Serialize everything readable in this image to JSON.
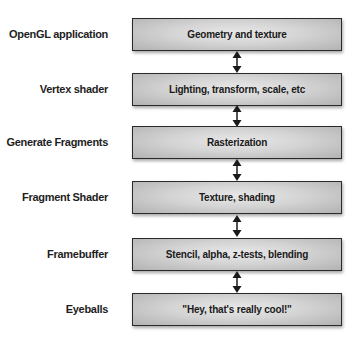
{
  "diagram": {
    "stages": [
      {
        "label": "OpenGL application",
        "description": "Geometry and texture"
      },
      {
        "label": "Vertex shader",
        "description": "Lighting, transform, scale, etc"
      },
      {
        "label": "Generate Fragments",
        "description": "Rasterization"
      },
      {
        "label": "Fragment Shader",
        "description": "Texture, shading"
      },
      {
        "label": "Framebuffer",
        "description": "Stencil, alpha, z-tests, blending"
      },
      {
        "label": "Eyeballs",
        "description": "\"Hey, that's really cool!\""
      }
    ],
    "connectors": [
      {
        "from": 0,
        "to": 1,
        "type": "double-arrow-icon"
      },
      {
        "from": 1,
        "to": 2,
        "type": "double-arrow-icon"
      },
      {
        "from": 2,
        "to": 3,
        "type": "double-arrow-icon"
      },
      {
        "from": 3,
        "to": 4,
        "type": "double-arrow-icon"
      },
      {
        "from": 4,
        "to": 5,
        "type": "double-arrow-icon"
      }
    ],
    "colors": {
      "box_border": "#2a2a2a",
      "box_fill_center": "#e8e8e8",
      "box_fill_edge": "#b2b2b2",
      "text": "#1e1e1e"
    }
  }
}
